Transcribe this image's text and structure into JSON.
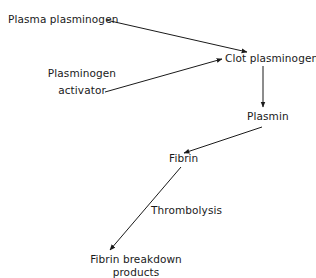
{
  "diagram": {
    "type": "flow",
    "nodes": [
      {
        "id": "plasma_plasminogen",
        "label": "Plasma plasminogen"
      },
      {
        "id": "plasminogen_activator",
        "label_lines": [
          "Plasminogen",
          "activator"
        ]
      },
      {
        "id": "clot_plasminogen",
        "label": "Clot plasminogen"
      },
      {
        "id": "plasmin",
        "label": "Plasmin"
      },
      {
        "id": "fibrin",
        "label": "Fibrin"
      },
      {
        "id": "fibrin_breakdown_products",
        "label_lines": [
          "Fibrin breakdown",
          "products"
        ]
      }
    ],
    "edges": [
      {
        "from": "plasma_plasminogen",
        "to": "clot_plasminogen"
      },
      {
        "from": "plasminogen_activator",
        "to": "clot_plasminogen"
      },
      {
        "from": "clot_plasminogen",
        "to": "plasmin"
      },
      {
        "from": "plasmin",
        "to": "fibrin"
      },
      {
        "from": "fibrin",
        "to": "fibrin_breakdown_products",
        "label": "Thrombolysis"
      }
    ],
    "colors": {
      "line": "#1a1a1a",
      "background": "#ffffff"
    }
  }
}
